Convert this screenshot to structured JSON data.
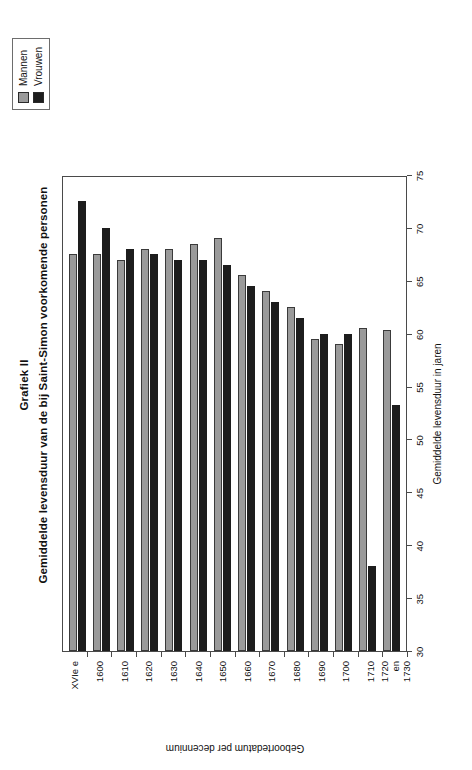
{
  "chart_data": {
    "type": "bar",
    "orientation": "vertical",
    "title": "Grafiek II",
    "subtitle": "Gemiddelde levensduur van de bij Saint-Simon voorkomende personen",
    "xlabel": "Geboortedatum per decennium",
    "ylabel": "Gemiddelde levensduur in jaren",
    "ylim": [
      30,
      75
    ],
    "ytick_step": 5,
    "yticks": [
      30,
      35,
      40,
      45,
      50,
      55,
      60,
      65,
      70,
      75
    ],
    "grid": false,
    "legend_position": "top-right",
    "categories": [
      "XVIe e",
      "1600",
      "1610",
      "1620",
      "1630",
      "1640",
      "1650",
      "1660",
      "1670",
      "1680",
      "1690",
      "1700",
      "1710",
      "1720 en 1730"
    ],
    "category_labels_multiline": [
      [
        "XVIe e"
      ],
      [
        "1600"
      ],
      [
        "1610"
      ],
      [
        "1620"
      ],
      [
        "1630"
      ],
      [
        "1640"
      ],
      [
        "1650"
      ],
      [
        "1660"
      ],
      [
        "1670"
      ],
      [
        "1680"
      ],
      [
        "1690"
      ],
      [
        "1700"
      ],
      [
        "1710"
      ],
      [
        "1720",
        "en",
        "1730"
      ]
    ],
    "series": [
      {
        "name": "Mannen",
        "color": "#9a9a9a",
        "values": [
          67.5,
          67.5,
          67.0,
          68.0,
          68.0,
          68.5,
          69.0,
          65.5,
          64.0,
          62.5,
          59.5,
          59.0,
          60.5,
          60.3
        ]
      },
      {
        "name": "Vrouwen",
        "color": "#1d1d1d",
        "values": [
          72.5,
          70.0,
          68.0,
          67.5,
          67.0,
          67.0,
          66.5,
          64.5,
          63.0,
          61.5,
          60.0,
          60.0,
          38.0,
          53.3
        ]
      }
    ]
  },
  "legend": {
    "items": [
      {
        "label": "Mannen",
        "color": "#9a9a9a"
      },
      {
        "label": "Vrouwen",
        "color": "#1d1d1d"
      }
    ]
  }
}
